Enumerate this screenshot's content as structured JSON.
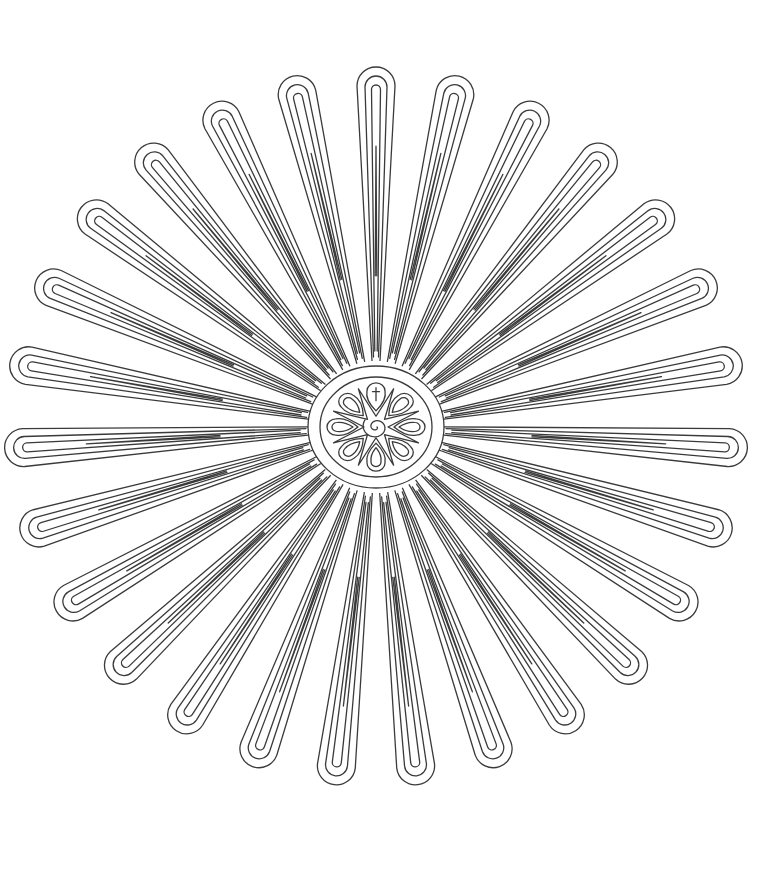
{
  "artwork": {
    "kind": "mandala-coloring-page",
    "title": "Radial petal mandala",
    "background": "#ffffff",
    "stroke_color": "#3a3a3a",
    "center": {
      "x": 376,
      "y": 427
    },
    "petals": {
      "count": 27,
      "outer_radius_x": 372,
      "outer_radius_y": 360,
      "outline_layers": 3,
      "rotation_offset_deg": -90
    },
    "medallion": {
      "outer_ring": {
        "rx": 68,
        "ry": 61
      },
      "inner_ring": {
        "rx": 56,
        "ry": 50
      },
      "star_points": 8,
      "teardrops": 8,
      "center_motif": "spiral",
      "top_motif": "cross"
    }
  }
}
